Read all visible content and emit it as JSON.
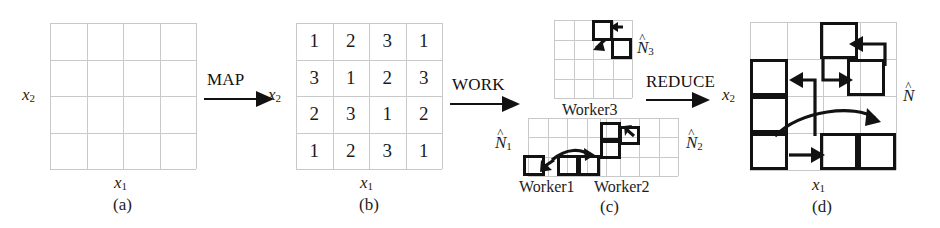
{
  "figure": {
    "caption_a": "(a)",
    "caption_b": "(b)",
    "caption_c": "(c)",
    "caption_d": "(d)",
    "axis_x": "x",
    "axis_x_sub": "1",
    "axis_y": "x",
    "axis_y_sub": "2"
  },
  "operators": {
    "map": "MAP",
    "work": "WORK",
    "reduce": "REDUCE"
  },
  "panel_a": {
    "name": "(a)",
    "grid_rows": 4,
    "grid_cols": 4,
    "xlabel": "x1",
    "ylabel": "x2"
  },
  "panel_b": {
    "name": "(b)",
    "grid_rows": 4,
    "grid_cols": 4,
    "xlabel": "x1",
    "ylabel": "x2",
    "values": [
      [
        "1",
        "2",
        "3",
        "1"
      ],
      [
        "3",
        "1",
        "2",
        "3"
      ],
      [
        "2",
        "3",
        "1",
        "2"
      ],
      [
        "1",
        "2",
        "3",
        "1"
      ]
    ]
  },
  "panel_c": {
    "name": "(c)",
    "workers": [
      {
        "label": "Worker3",
        "estimate": "N",
        "estimate_sub": "3"
      },
      {
        "label": "Worker1",
        "estimate": "N",
        "estimate_sub": "1"
      },
      {
        "label": "Worker2",
        "estimate": "N",
        "estimate_sub": "2"
      }
    ]
  },
  "panel_d": {
    "name": "(d)",
    "grid_rows": 4,
    "grid_cols": 4,
    "xlabel": "x1",
    "ylabel": "x2",
    "estimate": "N",
    "estimate_sub": ""
  },
  "colors": {
    "ink": "#121212",
    "grid_light": "#c9c9c9",
    "background": "#ffffff"
  }
}
